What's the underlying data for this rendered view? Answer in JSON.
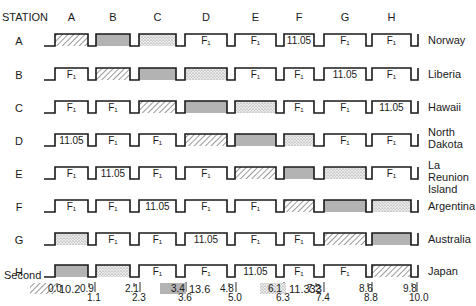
{
  "diagram": {
    "station_header": "STATION",
    "columns": [
      "A",
      "B",
      "C",
      "D",
      "E",
      "F",
      "G",
      "H"
    ],
    "fill_label": "F₁",
    "slots": [
      {
        "x0": 55,
        "x1": 88
      },
      {
        "x0": 96,
        "x1": 130
      },
      {
        "x0": 139,
        "x1": 176
      },
      {
        "x0": 185,
        "x1": 227
      },
      {
        "x0": 235,
        "x1": 276
      },
      {
        "x0": 284,
        "x1": 314
      },
      {
        "x0": 324,
        "x1": 366
      },
      {
        "x0": 372,
        "x1": 411
      }
    ],
    "rows": [
      {
        "station": "A",
        "country": "Norway",
        "slots": [
          "hatch",
          "gray",
          "dots",
          "F1",
          "F1",
          "11.05",
          "F1",
          "F1"
        ]
      },
      {
        "station": "B",
        "country": "Liberia",
        "slots": [
          "F1",
          "hatch",
          "gray",
          "dots",
          "F1",
          "F1",
          "11.05",
          "F1"
        ]
      },
      {
        "station": "C",
        "country": "Hawaii",
        "slots": [
          "F1",
          "F1",
          "hatch",
          "gray",
          "dots",
          "F1",
          "F1",
          "11.05"
        ]
      },
      {
        "station": "D",
        "country": "North Dakota",
        "country_lines": [
          "North",
          "Dakota"
        ],
        "slots": [
          "11.05",
          "F1",
          "F1",
          "hatch",
          "gray",
          "dots",
          "F1",
          "F1"
        ]
      },
      {
        "station": "E",
        "country": "La Reunion Island",
        "country_lines": [
          "La Reunion",
          "Island"
        ],
        "slots": [
          "F1",
          "11.05",
          "F1",
          "F1",
          "hatch",
          "gray",
          "dots",
          "F1"
        ]
      },
      {
        "station": "F",
        "country": "Argentina",
        "slots": [
          "F1",
          "F1",
          "11.05",
          "F1",
          "F1",
          "hatch",
          "gray",
          "dots"
        ]
      },
      {
        "station": "G",
        "country": "Australia",
        "slots": [
          "dots",
          "F1",
          "F1",
          "11.05",
          "F1",
          "F1",
          "hatch",
          "gray"
        ]
      },
      {
        "station": "H",
        "country": "Japan",
        "slots": [
          "gray",
          "dots",
          "F1",
          "F1",
          "11.05",
          "F1",
          "F1",
          "hatch"
        ]
      }
    ],
    "time_axis": {
      "label": "Second",
      "upper_ticks": [
        {
          "v": "0.0",
          "x": 57
        },
        {
          "v": "0.9",
          "x": 89
        },
        {
          "v": "2.1",
          "x": 134
        },
        {
          "v": "3.4",
          "x": 180
        },
        {
          "v": "4.8",
          "x": 229
        },
        {
          "v": "6.1",
          "x": 277
        },
        {
          "v": "7.2",
          "x": 316
        },
        {
          "v": "8.6",
          "x": 368
        },
        {
          "v": "9.8",
          "x": 412
        }
      ],
      "lower_ticks": [
        {
          "v": "1.1",
          "x": 97
        },
        {
          "v": "2.3",
          "x": 142
        },
        {
          "v": "3.6",
          "x": 188
        },
        {
          "v": "5.0",
          "x": 238
        },
        {
          "v": "6.3",
          "x": 286
        },
        {
          "v": "7.4",
          "x": 326
        },
        {
          "v": "8.8",
          "x": 374
        },
        {
          "v": "10.0",
          "x": 419
        }
      ]
    },
    "legend": [
      {
        "pattern": "hatch",
        "label": "10.2"
      },
      {
        "pattern": "gray",
        "label": "13.6"
      },
      {
        "pattern": "dots",
        "label": "11.333"
      }
    ],
    "colors": {
      "line": "#1a1a1a",
      "gray_fill": "#b3b3b3",
      "hatch": "#555555",
      "dots": "#8a8a8a"
    }
  }
}
